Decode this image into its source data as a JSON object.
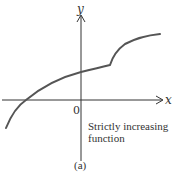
{
  "figure": {
    "axes": {
      "x_label": "x",
      "y_label": "y",
      "origin_label": "0"
    },
    "annotation": {
      "line1": "Strictly increasing",
      "line2": "function"
    },
    "caption": "(a)",
    "colors": {
      "curve": "#555555",
      "axes": "#333333",
      "background": "#ffffff"
    },
    "curve": {
      "description": "Strictly increasing function with a kink (corner) in the first quadrant",
      "points_px": [
        [
          6,
          128
        ],
        [
          26,
          100
        ],
        [
          81,
          72
        ],
        [
          110,
          65
        ],
        [
          160,
          34
        ]
      ]
    }
  }
}
